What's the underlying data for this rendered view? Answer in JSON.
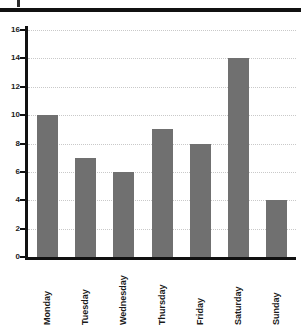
{
  "page": {
    "background_color": "#ffffff",
    "rule_color": "#111111"
  },
  "chart_data": {
    "type": "bar",
    "title": "",
    "subtitle": "",
    "xlabel": "",
    "ylabel": "",
    "categories": [
      "Monday",
      "Tuesday",
      "Wednesday",
      "Thursday",
      "Friday",
      "Saturday",
      "Sunday"
    ],
    "values": [
      10,
      7,
      6,
      9,
      8,
      14,
      4
    ],
    "ylim": [
      0,
      16
    ],
    "ytick_labels": [
      "0",
      "2",
      "4",
      "6",
      "8",
      "10",
      "12",
      "14",
      "16"
    ],
    "ytick_values": [
      0,
      2,
      4,
      6,
      8,
      10,
      12,
      14,
      16
    ],
    "grid": true,
    "grid_style": "dotted",
    "grid_color": "#c9c9c9",
    "legend": false,
    "legend_position": "none",
    "bar_color": "#707070",
    "axis_color": "#111111",
    "xtick_label_rotation": 90
  }
}
